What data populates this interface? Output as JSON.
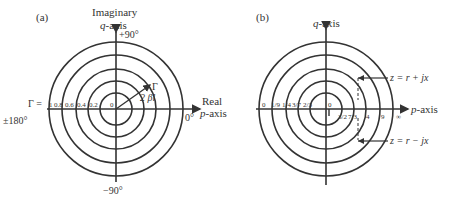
{
  "panel_a": {
    "label": "(a)",
    "y_axis_title_1": "Imaginary",
    "y_axis_title_2_var": "q",
    "y_axis_title_2_rest": "-axis",
    "x_axis_title_1": "Real",
    "x_axis_title_2_var": "p",
    "x_axis_title_2_rest": "-axis",
    "angle_top": "+90°",
    "angle_bottom": "−90°",
    "angle_right": "0°",
    "angle_left": "±180°",
    "gamma_symbol": "Γ =",
    "radial_ticks": [
      "1",
      "0.8",
      "0.6",
      "0.4",
      "0.2",
      "0"
    ],
    "vector_label": "Γ",
    "angle_label": "2 βl"
  },
  "panel_b": {
    "label": "(b)",
    "y_axis_title_var": "q",
    "y_axis_title_rest": "-axis",
    "x_axis_title_var": "p",
    "x_axis_title_rest": "-axis",
    "left_ticks": [
      "0",
      "1/9",
      "1/4",
      "3/7",
      "2/3",
      "0"
    ],
    "right_ticks": [
      "3/2",
      "7/3",
      "4",
      "9",
      "∞"
    ],
    "upper_annotation": "z = r + jx",
    "lower_annotation": "z = r − jx"
  },
  "colors": {
    "stroke": "#333333",
    "background": "#ffffff"
  }
}
